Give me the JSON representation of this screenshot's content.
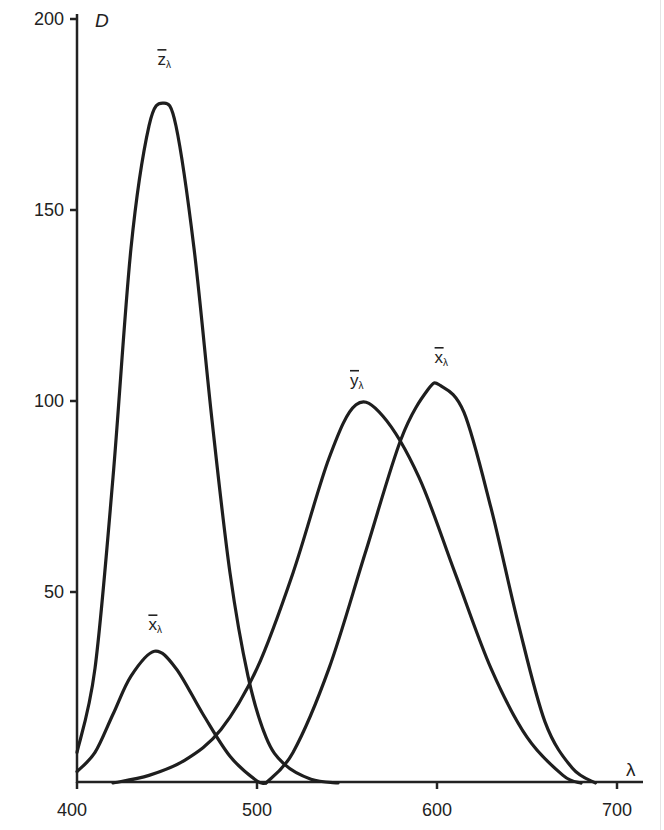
{
  "chart_data": {
    "type": "line",
    "title": "",
    "xlabel": "λ",
    "ylabel": "D",
    "xlim": [
      400,
      710
    ],
    "ylim": [
      0,
      200
    ],
    "grid": false,
    "legend": "none (curves labeled inline)",
    "x_ticks": [
      400,
      500,
      600,
      700
    ],
    "y_ticks": [
      50,
      100,
      150,
      200
    ],
    "series": [
      {
        "name": "z̄λ",
        "label_base": "z",
        "label_sub": "λ",
        "label_pos": [
          448,
          188
        ],
        "x": [
          400,
          410,
          420,
          430,
          440,
          448,
          455,
          465,
          475,
          485,
          495,
          505,
          515,
          530,
          545
        ],
        "y": [
          8,
          30,
          80,
          140,
          172,
          178,
          172,
          140,
          95,
          55,
          28,
          12,
          5,
          1,
          0
        ]
      },
      {
        "name": "ȳλ",
        "label_base": "y",
        "label_sub": "λ",
        "label_pos": [
          555,
          104
        ],
        "x": [
          420,
          440,
          460,
          480,
          500,
          520,
          540,
          555,
          570,
          590,
          610,
          630,
          650,
          670,
          680
        ],
        "y": [
          0,
          2,
          6,
          14,
          30,
          55,
          85,
          99,
          96,
          80,
          55,
          30,
          12,
          2,
          0
        ]
      },
      {
        "name": "x̄λ (long-wave)",
        "label_base": "x",
        "label_sub": "λ",
        "label_pos": [
          602,
          110
        ],
        "x": [
          505,
          520,
          540,
          560,
          580,
          595,
          602,
          615,
          630,
          645,
          660,
          675,
          688
        ],
        "y": [
          0,
          8,
          30,
          60,
          90,
          103,
          104,
          97,
          72,
          42,
          16,
          4,
          0
        ]
      },
      {
        "name": "x̄λ (short-wave)",
        "label_base": "x",
        "label_sub": "λ",
        "label_pos": [
          443,
          40
        ],
        "x": [
          400,
          410,
          420,
          430,
          443,
          455,
          470,
          485,
          500,
          505
        ],
        "y": [
          3,
          8,
          18,
          28,
          34.5,
          30,
          18,
          7,
          0.5,
          0
        ]
      }
    ]
  }
}
